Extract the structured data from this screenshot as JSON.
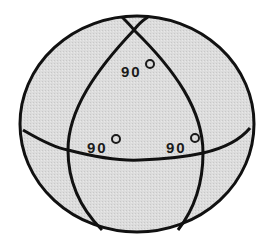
{
  "figure": {
    "fill_color": "#dcdcdc",
    "stroke_color": "#111111",
    "background": "#ffffff"
  },
  "angles": [
    {
      "id": "top",
      "value": "90",
      "unit": "°"
    },
    {
      "id": "left",
      "value": "90",
      "unit": "°"
    },
    {
      "id": "right",
      "value": "90",
      "unit": "°"
    }
  ]
}
